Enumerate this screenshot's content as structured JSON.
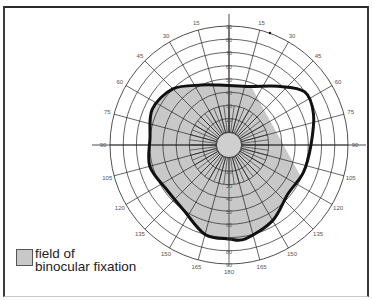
{
  "chart_data": {
    "type": "polar-diagram",
    "title": "",
    "center": [
      229,
      145
    ],
    "outer_radius": 119,
    "ring_labels": [
      "10",
      "20",
      "30",
      "40",
      "50",
      "60",
      "70",
      "80",
      "90"
    ],
    "ring_label_text": [
      "10",
      "20",
      "30",
      "40",
      "50",
      "60",
      "70",
      "80",
      "90"
    ],
    "angle_labels": [
      "15",
      "30",
      "45",
      "60",
      "75",
      "90",
      "105",
      "120",
      "135",
      "150",
      "165",
      "180",
      "165",
      "150",
      "135",
      "120",
      "105",
      "90",
      "75",
      "60",
      "45",
      "30",
      "15"
    ],
    "spoke_interval_deg": 15,
    "legend": [
      {
        "label": "field of binocular fixation",
        "color": "#c8c8c8"
      }
    ],
    "field_boundary_deg": [
      {
        "angle": 0,
        "r": 45
      },
      {
        "angle": 20,
        "r": 47
      },
      {
        "angle": 40,
        "r": 58
      },
      {
        "angle": 55,
        "r": 70
      },
      {
        "angle": 70,
        "r": 68
      },
      {
        "angle": 90,
        "r": 62
      },
      {
        "angle": 110,
        "r": 60
      },
      {
        "angle": 130,
        "r": 58
      },
      {
        "angle": 150,
        "r": 66
      },
      {
        "angle": 170,
        "r": 72
      },
      {
        "angle": 180,
        "r": 71
      },
      {
        "angle": 195,
        "r": 70
      },
      {
        "angle": 215,
        "r": 60
      },
      {
        "angle": 235,
        "r": 58
      },
      {
        "angle": 255,
        "r": 62
      },
      {
        "angle": 275,
        "r": 60
      },
      {
        "angle": 295,
        "r": 64
      },
      {
        "angle": 315,
        "r": 60
      },
      {
        "angle": 335,
        "r": 50
      },
      {
        "angle": 350,
        "r": 46
      }
    ]
  },
  "legend": {
    "line1": "field of",
    "line2": "binocular fixation"
  }
}
